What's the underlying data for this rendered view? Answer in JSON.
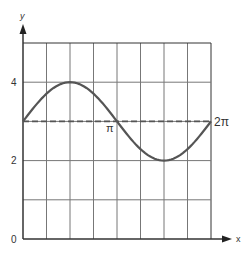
{
  "chart_data": {
    "type": "line",
    "title": "",
    "xlabel": "x",
    "ylabel": "y",
    "xlim": [
      0,
      6.2832
    ],
    "ylim": [
      0,
      5
    ],
    "grid": true,
    "x_gridlines": 8,
    "y_ticks": [
      {
        "value": 0,
        "label": "0"
      },
      {
        "value": 2,
        "label": "2"
      },
      {
        "value": 4,
        "label": "4"
      }
    ],
    "x_annotations": [
      {
        "value": 3.1416,
        "label": "π"
      },
      {
        "value": 6.2832,
        "label": "2π"
      }
    ],
    "series": [
      {
        "name": "y = 3 + sin x",
        "style": "solid",
        "function": "3 + sin(x)",
        "x": [
          0,
          0.785,
          1.571,
          2.356,
          3.142,
          3.927,
          4.712,
          5.498,
          6.283
        ],
        "values": [
          3,
          3.71,
          4,
          3.71,
          3,
          2.29,
          2,
          2.29,
          3
        ]
      },
      {
        "name": "y = 3 midline",
        "style": "dashed",
        "x": [
          0,
          6.283
        ],
        "values": [
          3,
          3
        ]
      }
    ]
  },
  "labels": {
    "x_axis": "x",
    "y_axis": "y",
    "y0": "0",
    "y2": "2",
    "y4": "4",
    "pi": "π",
    "two_pi": "2π"
  }
}
